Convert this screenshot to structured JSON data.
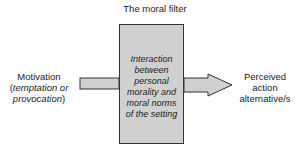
{
  "diagram": {
    "title": "The moral filter",
    "input": {
      "line1": "Motivation",
      "line2": "(",
      "line2_italic": "temptation or",
      "line3_italic": "provocation",
      "line3": ")"
    },
    "filter_box": {
      "lines": [
        "Interaction",
        "between",
        "personal",
        "morality and",
        "moral norms",
        "of the setting"
      ]
    },
    "output": {
      "lines": [
        "Perceived",
        "action",
        "alternative/s"
      ]
    },
    "colors": {
      "box_fill": "#d0d0d0",
      "arrow_fill": "#d0d0d0",
      "stroke": "#333333"
    }
  }
}
